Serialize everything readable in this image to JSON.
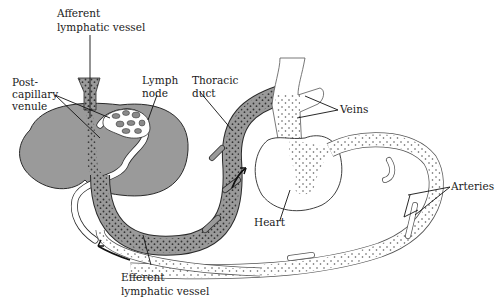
{
  "diagram": {
    "colors": {
      "background": "#ffffff",
      "lymph_tissue": "#9a9a9a",
      "outline": "#2a2a2a",
      "dots": "#3a3a3a"
    },
    "labels": {
      "afferent_line1": "Afferent",
      "afferent_line2": "lymphatic vessel",
      "postcap_line1": "Post-",
      "postcap_line2": "capillary",
      "postcap_line3": "venule",
      "lymphnode_line1": "Lymph",
      "lymphnode_line2": "node",
      "thoracic_line1": "Thoracic",
      "thoracic_line2": "duct",
      "veins": "Veins",
      "heart": "Heart",
      "arteries": "Arteries",
      "efferent_line1": "Efferent",
      "efferent_line2": "lymphatic vessel"
    }
  }
}
